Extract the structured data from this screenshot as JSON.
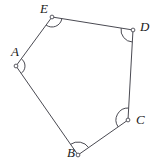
{
  "figure": {
    "type": "polygon",
    "shape_name": "pentagon",
    "canvas": {
      "width": 155,
      "height": 167
    },
    "background_color": "#ffffff",
    "stroke_color": "#4a4a52",
    "label_color": "#1a1a1a",
    "vertex_marker": {
      "shape": "circle",
      "radius": 1.9,
      "fill": "#ffffff",
      "stroke": "#4a4a52"
    },
    "vertices": [
      {
        "id": "A",
        "label": "A",
        "x": 16,
        "y": 66,
        "label_x": 11,
        "label_y": 56,
        "arc_radius": 9
      },
      {
        "id": "B",
        "label": "B",
        "x": 78,
        "y": 155,
        "label_x": 67,
        "label_y": 157,
        "arc_radius": 13
      },
      {
        "id": "C",
        "label": "C",
        "x": 128,
        "y": 120,
        "label_x": 136,
        "label_y": 124,
        "arc_radius": 12
      },
      {
        "id": "D",
        "label": "D",
        "x": 133,
        "y": 30,
        "label_x": 140,
        "label_y": 31,
        "arc_radius": 12
      },
      {
        "id": "E",
        "label": "E",
        "x": 52,
        "y": 17,
        "label_x": 40,
        "label_y": 13,
        "arc_radius": 10
      }
    ],
    "edges": [
      {
        "id": "AB",
        "from": "A",
        "to": "B"
      },
      {
        "id": "BC",
        "from": "B",
        "to": "C"
      },
      {
        "id": "CD",
        "from": "C",
        "to": "D"
      },
      {
        "id": "DE",
        "from": "D",
        "to": "E"
      },
      {
        "id": "EA",
        "from": "E",
        "to": "A"
      }
    ]
  }
}
